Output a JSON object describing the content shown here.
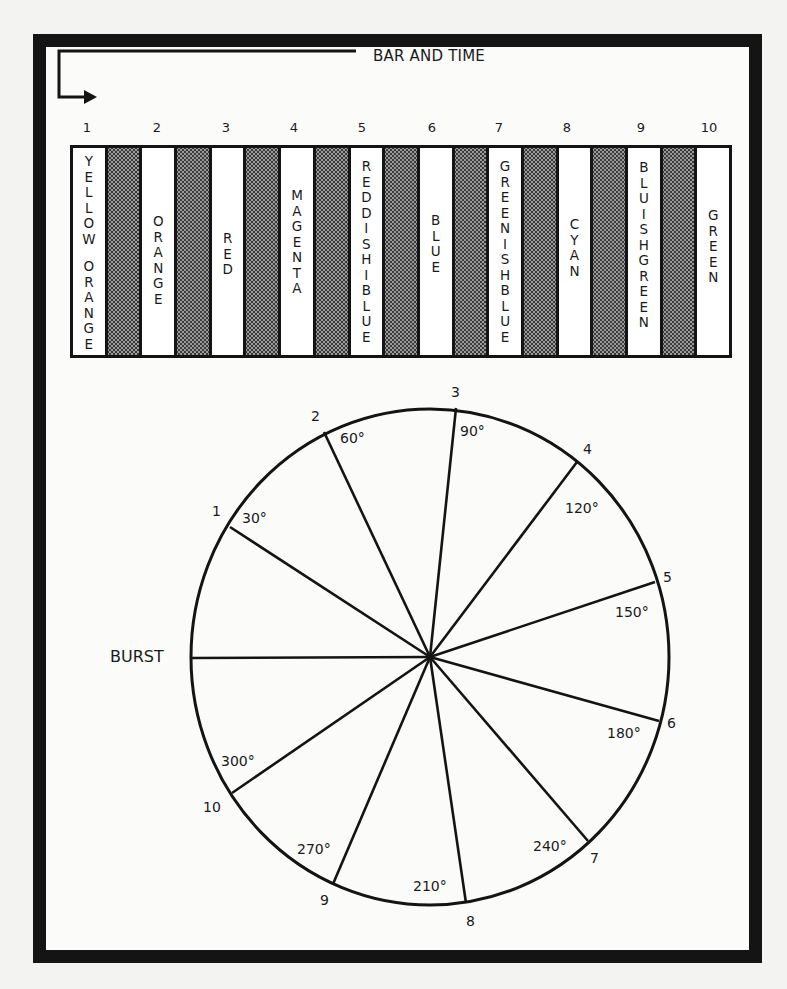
{
  "figure": {
    "title": "BAR AND TIME",
    "burst_label": "BURST",
    "bars": [
      {
        "index": "1",
        "label": "YELLOW ORANGE",
        "text_top": 6
      },
      {
        "index": "2",
        "label": "ORANGE",
        "text_top": 66
      },
      {
        "index": "3",
        "label": "RED",
        "text_top": 83
      },
      {
        "index": "4",
        "label": "MAGENTA",
        "text_top": 40
      },
      {
        "index": "5",
        "label": "REDDISHIBLUE",
        "text_top": 11
      },
      {
        "index": "6",
        "label": "BLUE",
        "text_top": 65
      },
      {
        "index": "7",
        "label": "GREENISHBLUE",
        "text_top": 11
      },
      {
        "index": "8",
        "label": "CYAN",
        "text_top": 69
      },
      {
        "index": "9",
        "label": "BLUISHGREEN",
        "text_top": 12
      },
      {
        "index": "10",
        "label": "GREEN",
        "text_top": 60
      }
    ],
    "wheel": {
      "spokes": [
        {
          "index": "1",
          "angle_label": "30°"
        },
        {
          "index": "2",
          "angle_label": "60°"
        },
        {
          "index": "3",
          "angle_label": "90°"
        },
        {
          "index": "4",
          "angle_label": "120°"
        },
        {
          "index": "5",
          "angle_label": "150°"
        },
        {
          "index": "6",
          "angle_label": "180°"
        },
        {
          "index": "7",
          "angle_label": "240°"
        },
        {
          "index": "8",
          "angle_label": "210°"
        },
        {
          "index": "9",
          "angle_label": "270°"
        },
        {
          "index": "10",
          "angle_label": "300°"
        }
      ]
    },
    "colors": {
      "ink": "#141414",
      "paper": "#fbfbfa",
      "stipple": "#9a9a9a"
    }
  }
}
